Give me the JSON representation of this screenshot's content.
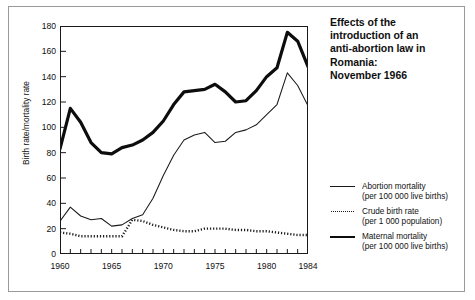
{
  "title": {
    "lines": [
      "Effects of the",
      "introduction of an",
      "anti-abortion law in",
      "Romania:",
      "November 1966"
    ]
  },
  "legend": {
    "items": [
      {
        "style": "thin-solid",
        "label": "Abortion mortality",
        "sublabel": "(per 100 000 live births)"
      },
      {
        "style": "dotted",
        "label": "Crude birth rate",
        "sublabel": "(per 1 000 population)"
      },
      {
        "style": "thick-solid",
        "label": "Maternal mortality",
        "sublabel": "(per 100 000 live births)"
      }
    ]
  },
  "axes": {
    "ylabel": "Birth rate/mortality rate",
    "yticks": [
      "0",
      "20",
      "40",
      "60",
      "80",
      "100",
      "120",
      "140",
      "160",
      "180"
    ],
    "xticks_labeled": [
      "1960",
      "1965",
      "1970",
      "1975",
      "1980",
      "1984"
    ]
  },
  "chart_data": {
    "type": "line",
    "xlabel": "",
    "ylabel": "Birth rate/mortality rate",
    "xlim": [
      1960,
      1984
    ],
    "ylim": [
      0,
      180
    ],
    "grid": false,
    "legend_position": "right",
    "x": [
      1960,
      1961,
      1962,
      1963,
      1964,
      1965,
      1966,
      1967,
      1968,
      1969,
      1970,
      1971,
      1972,
      1973,
      1974,
      1975,
      1976,
      1977,
      1978,
      1979,
      1980,
      1981,
      1982,
      1983,
      1984
    ],
    "series": [
      {
        "name": "Maternal mortality",
        "units": "per 100 000 live births",
        "style": "thick-solid",
        "color": "#0d0d0d",
        "values": [
          83,
          115,
          104,
          88,
          80,
          79,
          84,
          86,
          90,
          96,
          105,
          118,
          128,
          129,
          130,
          134,
          128,
          120,
          121,
          129,
          140,
          147,
          175,
          168,
          148
        ]
      },
      {
        "name": "Abortion mortality",
        "units": "per 100 000 live births",
        "style": "thin-solid",
        "color": "#1a1a1a",
        "values": [
          26,
          37,
          30,
          27,
          28,
          22,
          23,
          28,
          31,
          44,
          62,
          78,
          90,
          94,
          96,
          88,
          89,
          96,
          98,
          102,
          110,
          118,
          143,
          133,
          117
        ]
      },
      {
        "name": "Crude birth rate",
        "units": "per 1 000 population",
        "style": "dotted",
        "color": "#1a1a1a",
        "values": [
          17,
          16,
          14,
          14,
          14,
          14,
          14,
          27,
          26,
          23,
          21,
          19,
          18,
          18,
          20,
          20,
          20,
          19,
          19,
          18,
          18,
          17,
          16,
          15,
          15
        ]
      }
    ]
  }
}
